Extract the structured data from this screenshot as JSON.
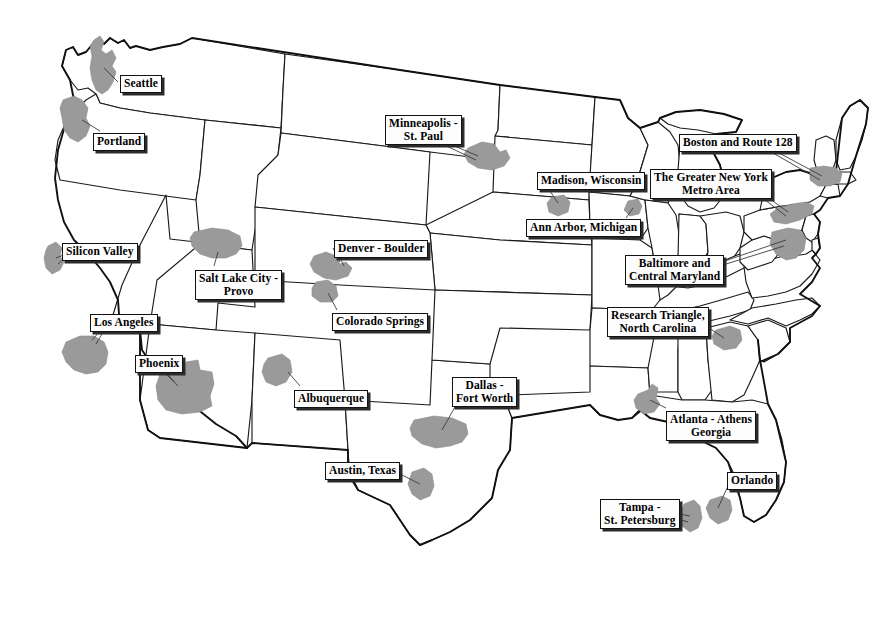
{
  "map": {
    "title": "United States Technology Hub Regions",
    "background_color": "#ffffff",
    "outline_color": "#111111",
    "metro_shade_color": "#9a9a9a",
    "label_border_color": "#121212",
    "label_shadow_color": "#2b2b2b"
  },
  "labels": [
    {
      "id": "seattle",
      "text": "Seattle",
      "x": 120,
      "y": 75,
      "lines": 1
    },
    {
      "id": "portland",
      "text": "Portland",
      "x": 93,
      "y": 133,
      "lines": 1
    },
    {
      "id": "silicon-valley",
      "text": "Silicon Valley",
      "x": 62,
      "y": 243,
      "lines": 1
    },
    {
      "id": "los-angeles",
      "text": "Los Angeles",
      "x": 90,
      "y": 314,
      "lines": 1
    },
    {
      "id": "phoenix",
      "text": "Phoenix",
      "x": 135,
      "y": 355,
      "lines": 1
    },
    {
      "id": "salt-lake-city",
      "text": "Salt Lake City -\nProvo",
      "x": 195,
      "y": 270,
      "lines": 2
    },
    {
      "id": "denver-boulder",
      "text": "Denver - Boulder",
      "x": 334,
      "y": 240,
      "lines": 1
    },
    {
      "id": "colorado-springs",
      "text": "Colorado Springs",
      "x": 332,
      "y": 313,
      "lines": 1
    },
    {
      "id": "albuquerque",
      "text": "Albuquerque",
      "x": 294,
      "y": 390,
      "lines": 1
    },
    {
      "id": "austin",
      "text": "Austin, Texas",
      "x": 325,
      "y": 462,
      "lines": 1
    },
    {
      "id": "dallas",
      "text": "Dallas -\nFort Worth",
      "x": 452,
      "y": 377,
      "lines": 2
    },
    {
      "id": "minneapolis",
      "text": "Minneapolis -\nSt. Paul",
      "x": 385,
      "y": 115,
      "lines": 2
    },
    {
      "id": "madison",
      "text": "Madison, Wisconsin",
      "x": 537,
      "y": 172,
      "lines": 1
    },
    {
      "id": "ann-arbor",
      "text": "Ann Arbor, Michigan",
      "x": 526,
      "y": 219,
      "lines": 1
    },
    {
      "id": "boston",
      "text": "Boston and Route 128",
      "x": 679,
      "y": 134,
      "lines": 1
    },
    {
      "id": "new-york",
      "text": "The Greater New York\nMetro Area",
      "x": 650,
      "y": 169,
      "lines": 2
    },
    {
      "id": "baltimore",
      "text": "Baltimore and\nCentral Maryland",
      "x": 625,
      "y": 255,
      "lines": 2
    },
    {
      "id": "research-triangle",
      "text": "Research Triangle,\nNorth Carolina",
      "x": 607,
      "y": 307,
      "lines": 2
    },
    {
      "id": "atlanta",
      "text": "Atlanta - Athens\nGeorgia",
      "x": 666,
      "y": 411,
      "lines": 2
    },
    {
      "id": "orlando",
      "text": "Orlando",
      "x": 727,
      "y": 472,
      "lines": 1
    },
    {
      "id": "tampa",
      "text": "Tampa -\nSt. Petersburg",
      "x": 600,
      "y": 499,
      "lines": 2
    }
  ],
  "metro_regions": [
    {
      "id": "seattle-blob",
      "name": "Seattle"
    },
    {
      "id": "portland-blob",
      "name": "Portland"
    },
    {
      "id": "silicon-valley-blob",
      "name": "Silicon Valley"
    },
    {
      "id": "los-angeles-blob",
      "name": "Los Angeles"
    },
    {
      "id": "phoenix-blob",
      "name": "Phoenix"
    },
    {
      "id": "salt-lake-blob",
      "name": "Salt Lake City - Provo"
    },
    {
      "id": "denver-blob",
      "name": "Denver - Boulder"
    },
    {
      "id": "colorado-springs-blob",
      "name": "Colorado Springs"
    },
    {
      "id": "albuquerque-blob",
      "name": "Albuquerque"
    },
    {
      "id": "austin-blob",
      "name": "Austin, Texas"
    },
    {
      "id": "dallas-blob",
      "name": "Dallas - Fort Worth"
    },
    {
      "id": "minneapolis-blob",
      "name": "Minneapolis - St. Paul"
    },
    {
      "id": "madison-blob",
      "name": "Madison, Wisconsin"
    },
    {
      "id": "ann-arbor-blob",
      "name": "Ann Arbor, Michigan"
    },
    {
      "id": "boston-blob",
      "name": "Boston and Route 128"
    },
    {
      "id": "new-york-blob",
      "name": "The Greater New York Metro Area"
    },
    {
      "id": "baltimore-blob",
      "name": "Baltimore and Central Maryland"
    },
    {
      "id": "research-triangle-blob",
      "name": "Research Triangle, North Carolina"
    },
    {
      "id": "atlanta-blob",
      "name": "Atlanta - Athens Georgia"
    },
    {
      "id": "orlando-blob",
      "name": "Orlando"
    },
    {
      "id": "tampa-blob",
      "name": "Tampa - St. Petersburg"
    }
  ]
}
